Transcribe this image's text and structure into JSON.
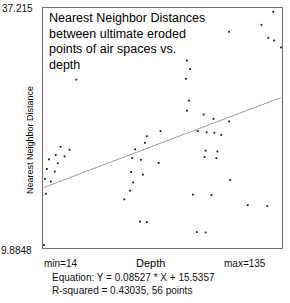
{
  "chart_data": {
    "type": "scatter",
    "title": "Nearest Neighbor Distances\nbetween ultimate eroded\npoints of air spaces vs.\ndepth",
    "xlabel": "Depth",
    "ylabel": "Nearest Neighbor Distance",
    "xlim": [
      14,
      135
    ],
    "ylim": [
      9.8848,
      37.215
    ],
    "xmin_label": "min=14",
    "xmax_label": "max=135",
    "ymin_label": "9.8848",
    "ymax_label": "37.215",
    "grid": false,
    "legend": false,
    "n_points": 56,
    "equation_text": "Equation: Y = 0.08527 * X + 15.5357",
    "rsquared_text": "R-squared = 0.43035, 56 points",
    "slope": 0.08527,
    "intercept": 15.5357,
    "r_squared": 0.43035,
    "marker_color": "#1a1a1a",
    "line_color": "#8d8d8d",
    "frame_color": "#6f6f6f",
    "fit_line": {
      "x": [
        14,
        135
      ],
      "y": [
        16.729,
        27.047
      ]
    },
    "points": [
      {
        "x": 131.0,
        "y": 36.9
      },
      {
        "x": 125.0,
        "y": 35.4
      },
      {
        "x": 108.5,
        "y": 34.6
      },
      {
        "x": 128.5,
        "y": 33.9
      },
      {
        "x": 131.5,
        "y": 33.6
      },
      {
        "x": 135.0,
        "y": 32.8
      },
      {
        "x": 87.0,
        "y": 31.3
      },
      {
        "x": 88.5,
        "y": 30.3
      },
      {
        "x": 86.5,
        "y": 29.2
      },
      {
        "x": 88.0,
        "y": 26.7
      },
      {
        "x": 87.0,
        "y": 25.55
      },
      {
        "x": 30.5,
        "y": 29.1
      },
      {
        "x": 73.5,
        "y": 23.2
      },
      {
        "x": 66.5,
        "y": 22.6
      },
      {
        "x": 65.5,
        "y": 21.85
      },
      {
        "x": 60.5,
        "y": 21.1
      },
      {
        "x": 22.5,
        "y": 21.4
      },
      {
        "x": 27.0,
        "y": 21.05
      },
      {
        "x": 20.0,
        "y": 20.45
      },
      {
        "x": 24.5,
        "y": 20.3
      },
      {
        "x": 16.5,
        "y": 19.95
      },
      {
        "x": 21.0,
        "y": 19.5
      },
      {
        "x": 59.0,
        "y": 20.1
      },
      {
        "x": 63.5,
        "y": 19.9
      },
      {
        "x": 72.5,
        "y": 19.55
      },
      {
        "x": 15.5,
        "y": 18.85
      },
      {
        "x": 19.5,
        "y": 18.55
      },
      {
        "x": 58.5,
        "y": 18.5
      },
      {
        "x": 64.5,
        "y": 18.2
      },
      {
        "x": 14.5,
        "y": 17.7
      },
      {
        "x": 17.5,
        "y": 17.4
      },
      {
        "x": 59.5,
        "y": 17.3
      },
      {
        "x": 58.0,
        "y": 16.35
      },
      {
        "x": 15.0,
        "y": 16.0
      },
      {
        "x": 55.0,
        "y": 15.35
      },
      {
        "x": 95.5,
        "y": 25.1
      },
      {
        "x": 100.5,
        "y": 24.6
      },
      {
        "x": 108.5,
        "y": 24.3
      },
      {
        "x": 92.5,
        "y": 23.2
      },
      {
        "x": 97.0,
        "y": 23.05
      },
      {
        "x": 101.0,
        "y": 23.0
      },
      {
        "x": 104.5,
        "y": 22.75
      },
      {
        "x": 96.5,
        "y": 20.95
      },
      {
        "x": 102.5,
        "y": 20.85
      },
      {
        "x": 96.0,
        "y": 20.2
      },
      {
        "x": 102.0,
        "y": 20.1
      },
      {
        "x": 109.0,
        "y": 17.6
      },
      {
        "x": 90.0,
        "y": 15.9
      },
      {
        "x": 99.5,
        "y": 15.85
      },
      {
        "x": 118.0,
        "y": 14.7
      },
      {
        "x": 128.0,
        "y": 14.6
      },
      {
        "x": 63.0,
        "y": 12.8
      },
      {
        "x": 66.5,
        "y": 12.75
      },
      {
        "x": 92.0,
        "y": 11.6
      },
      {
        "x": 96.5,
        "y": 11.55
      },
      {
        "x": 14.0,
        "y": 10.1
      }
    ]
  }
}
